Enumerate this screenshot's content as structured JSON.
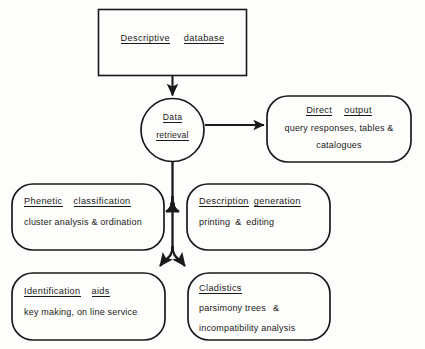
{
  "diagram": {
    "stroke_color": "#1a1a1a",
    "background_color": "#fdfdfb",
    "nodes": {
      "database": {
        "shape": "rectangle",
        "title_part1": "Descriptive",
        "title_part2": "database"
      },
      "retrieval": {
        "shape": "circle",
        "line1": "Data",
        "line2": "retrieval"
      },
      "direct_output": {
        "shape": "rounded-rectangle",
        "title_part1": "Direct",
        "title_part2": "output",
        "body_line1": "query responses, tables  &",
        "body_line2": "catalogues"
      },
      "phenetic": {
        "shape": "rounded-rectangle",
        "title_part1": "Phenetic",
        "title_part2": "classification",
        "body_line1": "cluster analysis & ordination"
      },
      "description_generation": {
        "shape": "rounded-rectangle",
        "title_part1": "Description",
        "title_part2": "generation",
        "body_part1": "printing",
        "body_part2": "&",
        "body_part3": "editing"
      },
      "identification": {
        "shape": "rounded-rectangle",
        "title_part1": "Identification",
        "title_part2": "aids",
        "body_line1": "key making, on line service"
      },
      "cladistics": {
        "shape": "rounded-rectangle",
        "title_part1": "Cladistics",
        "body_part1": "parsimony  trees",
        "body_part2": "&",
        "body_line2": "incompatibility analysis"
      }
    },
    "connectors": [
      {
        "name": "database-to-retrieval",
        "from": "database",
        "to": "retrieval",
        "style": "straight-down-arrow"
      },
      {
        "name": "retrieval-to-direct-output",
        "from": "retrieval",
        "to": "direct_output",
        "style": "straight-right-arrow"
      },
      {
        "name": "retrieval-to-phenetic",
        "from": "retrieval",
        "to": "phenetic",
        "style": "split-left-arrow"
      },
      {
        "name": "retrieval-to-description",
        "from": "retrieval",
        "to": "description_generation",
        "style": "split-right-arrow"
      },
      {
        "name": "retrieval-to-identification",
        "from": "retrieval",
        "to": "identification",
        "style": "curved-down-left-arrow"
      },
      {
        "name": "retrieval-to-cladistics",
        "from": "retrieval",
        "to": "cladistics",
        "style": "curved-down-right-arrow"
      }
    ]
  }
}
